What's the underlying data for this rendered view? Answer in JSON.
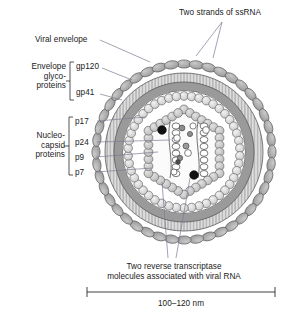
{
  "figure": {
    "scale_bar": {
      "label": "100–120 nm",
      "x_start": 87,
      "x_end": 275,
      "y": 292
    }
  },
  "labels": {
    "viral_envelope": "Viral envelope",
    "two_strands_ssrna": "Two strands of ssRNA",
    "envelope_glycoproteins": "Envelope\nglyco-\nproteins",
    "gp120": "gp120",
    "gp41": "gp41",
    "nucleocapsid_proteins": "Nucleo-\ncapsid\nproteins",
    "p17": "p17",
    "p24": "p24",
    "p9": "p9",
    "p7": "p7",
    "reverse_transcriptase_line1": "Two reverse transcriptase",
    "reverse_transcriptase_line2": "molecules associated with viral RNA",
    "scale": "100–120 nm"
  },
  "colors": {
    "stroke": "#4a4a4a",
    "text": "#1a1a1a",
    "spike_fill": "#b4b4b4",
    "membrane_fill": "#d8d8d8",
    "membrane_dark": "#8f8f8f",
    "matrix_bead": "#dcdcdc",
    "capsid_bead": "#c8c8c8",
    "rna_open": "#ffffff",
    "rt_fill": "#111111",
    "leader": "#6e6e8a",
    "background": "#ffffff"
  },
  "geometry": {
    "center_x": 184,
    "center_y": 152,
    "spike_ring_radius": 88,
    "membrane_outer_radius": 78,
    "membrane_inner_radius": 70,
    "dark_band_outer_radius": 70,
    "dark_band_inner_radius": 62,
    "matrix_ring_radius": 56,
    "capsid_radius": 38,
    "spike_count": 44,
    "matrix_bead_count": 46,
    "capsid_bead_count": 34,
    "rna_strand_count": 2,
    "reverse_transcriptase_count": 2
  }
}
